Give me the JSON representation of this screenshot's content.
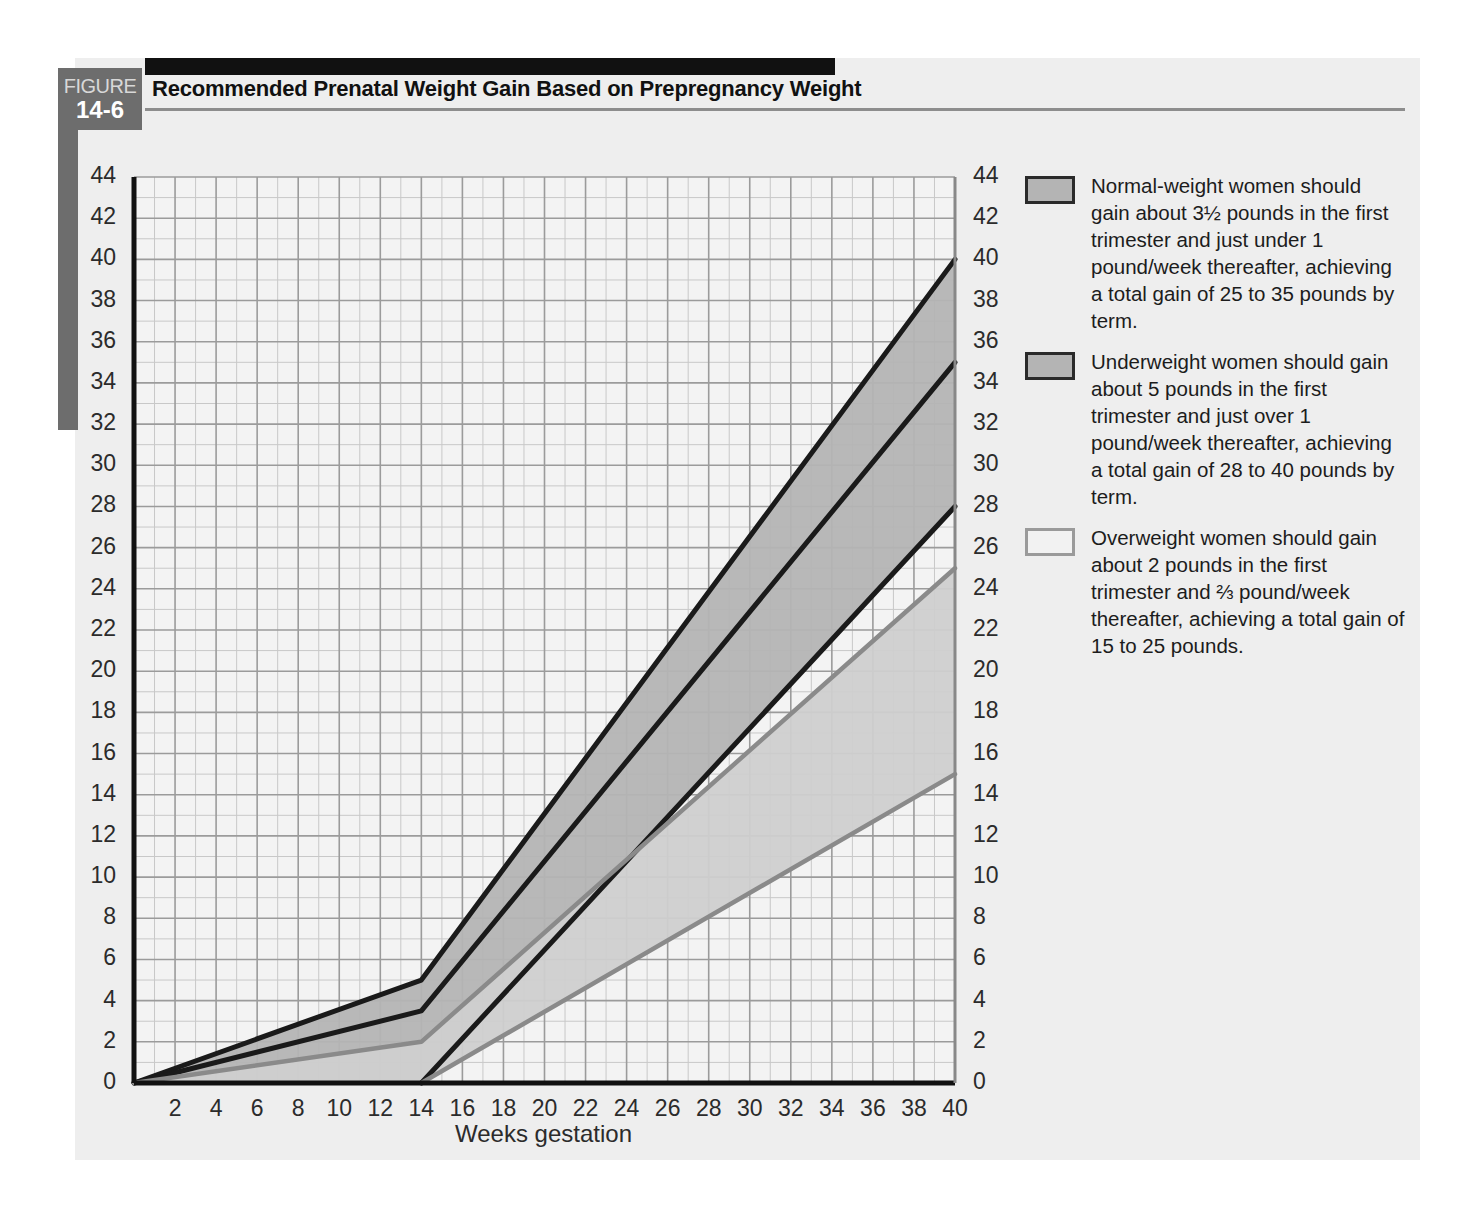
{
  "figure": {
    "badge_word": "FIGURE",
    "badge_number": "14-6",
    "title": "Recommended Prenatal Weight Gain Based on Prepregnancy Weight"
  },
  "legend": {
    "items": [
      {
        "swatch": "normal-weight-swatch",
        "color": "#b4b4b4",
        "text": "Normal-weight women should gain about 3½ pounds in the first trimester and just under 1 pound/week thereafter, achieving a total gain of 25 to 35 pounds by term."
      },
      {
        "swatch": "underweight-swatch",
        "color": "#b4b4b4",
        "text": "Underweight women should gain about 5 pounds in the first trimester and just over 1 pound/week thereafter, achieving a total gain of 28 to 40 pounds by term."
      },
      {
        "swatch": "overweight-swatch",
        "color": "#f2f2f2",
        "text": "Overweight women should gain about 2 pounds in the first trimester and ⅔ pound/week thereafter, achieving a total gain of 15 to 25 pounds."
      }
    ]
  },
  "chart_data": {
    "type": "area",
    "title": "Recommended Prenatal Weight Gain Based on Prepregnancy Weight",
    "xlabel": "Weeks gestation",
    "ylabel": "",
    "xlim": [
      0,
      40
    ],
    "ylim": [
      0,
      44
    ],
    "x_ticks": [
      0,
      2,
      4,
      6,
      8,
      10,
      12,
      14,
      16,
      18,
      20,
      22,
      24,
      26,
      28,
      30,
      32,
      34,
      36,
      38,
      40
    ],
    "y_ticks": [
      0,
      2,
      4,
      6,
      8,
      10,
      12,
      14,
      16,
      18,
      20,
      22,
      24,
      26,
      28,
      30,
      32,
      34,
      36,
      38,
      40,
      42,
      44
    ],
    "x_tick_labels": [
      "0",
      "2",
      "4",
      "6",
      "8",
      "10",
      "12",
      "14",
      "16",
      "18",
      "20",
      "22",
      "24",
      "26",
      "28",
      "30",
      "32",
      "34",
      "36",
      "38",
      "40"
    ],
    "y_tick_labels": [
      "0",
      "2",
      "4",
      "6",
      "8",
      "10",
      "12",
      "14",
      "16",
      "18",
      "20",
      "22",
      "24",
      "26",
      "28",
      "30",
      "32",
      "34",
      "36",
      "38",
      "40",
      "42",
      "44"
    ],
    "grid": true,
    "grid_minor_step": 1,
    "grid_major_step": 2,
    "dual_y_axis": true,
    "legend_position": "right",
    "series": [
      {
        "name": "Underweight upper bound",
        "style": "dark-line",
        "color": "#1a1a1a",
        "x": [
          0,
          14,
          40
        ],
        "values": [
          0,
          5,
          40
        ]
      },
      {
        "name": "Normal-weight upper bound",
        "style": "dark-line",
        "color": "#1a1a1a",
        "x": [
          0,
          14,
          40
        ],
        "values": [
          0,
          3.5,
          35
        ]
      },
      {
        "name": "Underweight lower bound / Normal-weight lower bound",
        "style": "dark-line",
        "color": "#1a1a1a",
        "x": [
          14,
          40
        ],
        "values": [
          0,
          28
        ]
      },
      {
        "name": "Overweight upper bound",
        "style": "gray-line",
        "color": "#8a8a8a",
        "x": [
          0,
          14,
          40
        ],
        "values": [
          0,
          2,
          25
        ]
      },
      {
        "name": "Overweight lower bound",
        "style": "gray-line",
        "color": "#8a8a8a",
        "x": [
          14,
          40
        ],
        "values": [
          0,
          15
        ]
      }
    ],
    "bands": [
      {
        "name": "Underweight band",
        "fill": "#b4b4b4",
        "upper": {
          "x": [
            0,
            14,
            40
          ],
          "values": [
            0,
            5,
            40
          ]
        },
        "lower": {
          "x": [
            0,
            14,
            40
          ],
          "values": [
            0,
            3.5,
            35
          ]
        }
      },
      {
        "name": "Normal-weight band",
        "fill": "#b4b4b4",
        "upper": {
          "x": [
            0,
            14,
            40
          ],
          "values": [
            0,
            3.5,
            35
          ]
        },
        "lower": {
          "x": [
            0,
            14,
            40
          ],
          "values": [
            0,
            0,
            28
          ]
        }
      },
      {
        "name": "Overweight band",
        "fill": "#cfcfcf",
        "upper": {
          "x": [
            0,
            14,
            40
          ],
          "values": [
            0,
            2,
            25
          ]
        },
        "lower": {
          "x": [
            0,
            14,
            40
          ],
          "values": [
            0,
            0,
            15
          ]
        }
      }
    ]
  }
}
